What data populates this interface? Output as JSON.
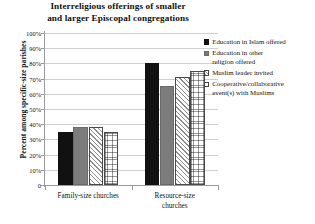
{
  "chart_data": {
    "type": "bar",
    "title_lines": [
      "Interreligious offerings of smaller",
      "and larger Episcopal congregations"
    ],
    "xlabel": "",
    "ylabel": "Percent among specific-size parishes",
    "ylim": [
      0,
      100
    ],
    "ytick_labels": [
      "100%",
      "90%",
      "80%",
      "70%",
      "60%",
      "50%",
      "40%",
      "30%",
      "20%",
      "10%",
      "0"
    ],
    "ytick_values": [
      100,
      90,
      80,
      70,
      60,
      50,
      40,
      30,
      20,
      10,
      0
    ],
    "grid": true,
    "legend_position": "right",
    "categories": [
      "Family-size churches",
      "Resource-size churches"
    ],
    "category_lines": [
      [
        "Family-size churches"
      ],
      [
        "Resource-size",
        "churches"
      ]
    ],
    "series": [
      {
        "name": "Education in Islam offered",
        "name_lines": [
          "Education in Islam offered"
        ],
        "pattern": "solid-black",
        "color": "#111111",
        "values": [
          35,
          80
        ]
      },
      {
        "name": "Education in other religion offered",
        "name_lines": [
          "Education in other",
          "religion offered"
        ],
        "pattern": "solid-gray",
        "color": "#7c7c7c",
        "values": [
          38,
          65
        ]
      },
      {
        "name": "Muslim leader invited",
        "name_lines": [
          "Muslim leader invited"
        ],
        "pattern": "hatch",
        "color": "#8e8e8e",
        "values": [
          38,
          71
        ]
      },
      {
        "name": "Cooperative/collaborative event(s) with Muslims",
        "name_lines": [
          "Cooperative/collaborative",
          "event(s) with Muslims"
        ],
        "pattern": "dots",
        "color": "#9a9a9a",
        "values": [
          35,
          75
        ]
      }
    ]
  }
}
